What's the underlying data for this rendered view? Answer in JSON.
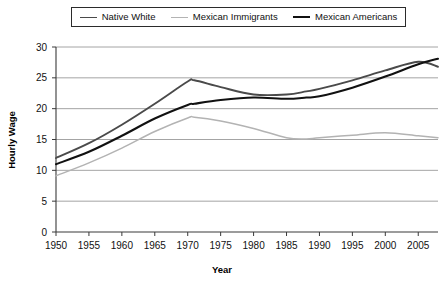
{
  "chart_data": {
    "type": "line",
    "title": "",
    "xlabel": "Year",
    "ylabel": "Hourly Wage",
    "xlim": [
      1950,
      2008
    ],
    "ylim": [
      0,
      30
    ],
    "grid": true,
    "legend_position": "top",
    "xticks": [
      1950,
      1955,
      1960,
      1965,
      1970,
      1975,
      1980,
      1985,
      1990,
      1995,
      2000,
      2005
    ],
    "xtick_labels": [
      "1950",
      "1955",
      "1960",
      "1965",
      "1970",
      "1975",
      "1980",
      "1985",
      "1990",
      "1995",
      "2000",
      "2005"
    ],
    "yticks": [
      0,
      5,
      10,
      15,
      20,
      25,
      30
    ],
    "ytick_labels": [
      "0",
      "5",
      "10",
      "15",
      "20",
      "25",
      "30"
    ],
    "x": [
      1950,
      1955,
      1960,
      1965,
      1970,
      1971,
      1975,
      1980,
      1985,
      1988,
      1990,
      1995,
      2000,
      2005,
      2008
    ],
    "series": [
      {
        "name": "Native White",
        "color": "#4a4a4a",
        "width": 1.9,
        "values": [
          12.0,
          14.4,
          17.4,
          20.8,
          24.4,
          24.6,
          23.5,
          22.3,
          22.3,
          22.8,
          23.2,
          24.6,
          26.2,
          27.6,
          26.8
        ]
      },
      {
        "name": "Mexican Immigrants",
        "color": "#b3b3b3",
        "width": 1.5,
        "values": [
          9.1,
          11.2,
          13.6,
          16.3,
          18.5,
          18.6,
          18.0,
          16.8,
          15.3,
          15.1,
          15.3,
          15.7,
          16.1,
          15.6,
          15.3
        ]
      },
      {
        "name": "Mexican Americans",
        "color": "#111111",
        "width": 2.1,
        "values": [
          11.0,
          13.0,
          15.6,
          18.4,
          20.6,
          20.8,
          21.4,
          21.8,
          21.6,
          21.8,
          22.0,
          23.4,
          25.2,
          27.2,
          28.1
        ]
      }
    ]
  },
  "legend": {
    "entries": [
      {
        "label": "Native White"
      },
      {
        "label": "Mexican Immigrants"
      },
      {
        "label": "Mexican Americans"
      }
    ]
  },
  "axes": {
    "y_title": "Hourly Wage",
    "x_title": "Year"
  }
}
